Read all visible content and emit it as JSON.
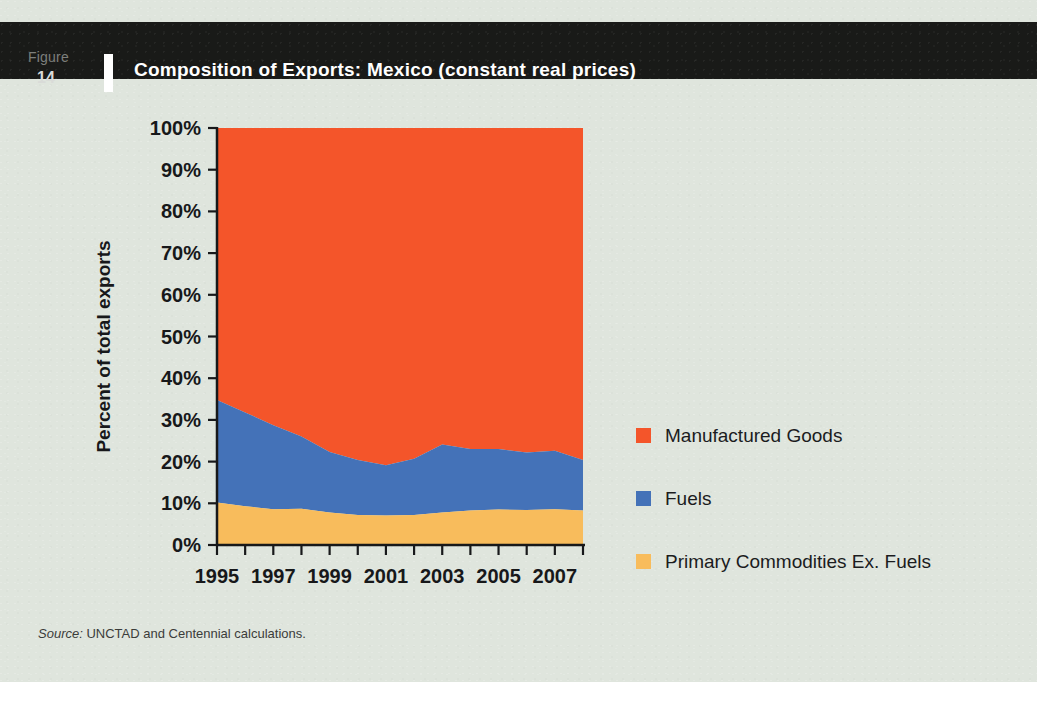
{
  "figure": {
    "label": "Figure",
    "number": "14",
    "title": "Composition of Exports: Mexico (constant real prices)"
  },
  "colors": {
    "background": "#dfe5dd",
    "header": "#191a18",
    "manufactured": "#F4552A",
    "fuels": "#4472B8",
    "primary": "#F8BC5C",
    "axis": "#17181a"
  },
  "legend": {
    "items": [
      {
        "label": "Manufactured Goods",
        "color": "#F4552A",
        "swatch": "legend-swatch-manufactured"
      },
      {
        "label": "Fuels",
        "color": "#4472B8",
        "swatch": "legend-swatch-fuels"
      },
      {
        "label": "Primary Commodities Ex. Fuels",
        "color": "#F8BC5C",
        "swatch": "legend-swatch-primary"
      }
    ]
  },
  "source": {
    "label": "Source:",
    "text": "UNCTAD and Centennial calculations."
  },
  "chart_data": {
    "type": "area",
    "stacked": true,
    "normalized": true,
    "title": "Composition of Exports: Mexico (constant real prices)",
    "xlabel": "",
    "ylabel": "Percent of total exports",
    "ylim": [
      0,
      100
    ],
    "yticks": [
      0,
      10,
      20,
      30,
      40,
      50,
      60,
      70,
      80,
      90,
      100
    ],
    "ytick_labels": [
      "0%",
      "10%",
      "20%",
      "30%",
      "40%",
      "50%",
      "60%",
      "70%",
      "80%",
      "90%",
      "100%"
    ],
    "x": [
      1995,
      1996,
      1997,
      1998,
      1999,
      2000,
      2001,
      2002,
      2003,
      2004,
      2005,
      2006,
      2007,
      2008
    ],
    "xticks": [
      1995,
      1996,
      1997,
      1998,
      1999,
      2000,
      2001,
      2002,
      2003,
      2004,
      2005,
      2006,
      2007,
      2008
    ],
    "xtick_labels": [
      "1995",
      "",
      "1997",
      "",
      "1999",
      "",
      "2001",
      "",
      "2003",
      "",
      "2005",
      "",
      "2007",
      ""
    ],
    "xtick_labels_shown": [
      "1995",
      "1997",
      "1999",
      "2001",
      "2003",
      "2005",
      "2007"
    ],
    "grid": false,
    "legend_position": "right",
    "series": [
      {
        "name": "Primary Commodities Ex. Fuels",
        "color": "#F8BC5C",
        "values": [
          10.2,
          9.3,
          8.6,
          8.7,
          7.8,
          7.2,
          7.1,
          7.2,
          7.8,
          8.3,
          8.5,
          8.4,
          8.6,
          8.3
        ]
      },
      {
        "name": "Fuels",
        "color": "#4472B8",
        "values": [
          24.6,
          22.5,
          20.1,
          17.3,
          14.5,
          13.2,
          12.0,
          13.5,
          16.3,
          14.7,
          14.5,
          13.8,
          14.0,
          12.1
        ]
      },
      {
        "name": "Manufactured Goods",
        "color": "#F4552A",
        "values": [
          65.2,
          68.2,
          71.3,
          74.0,
          77.7,
          79.6,
          80.9,
          79.3,
          75.9,
          77.0,
          77.0,
          77.8,
          77.4,
          79.6
        ]
      }
    ],
    "cumulative_tops": {
      "primary": [
        10.2,
        9.3,
        8.6,
        8.7,
        7.8,
        7.2,
        7.1,
        7.2,
        7.8,
        8.3,
        8.5,
        8.4,
        8.6,
        8.3
      ],
      "fuels": [
        34.8,
        31.8,
        28.7,
        26.0,
        22.3,
        20.4,
        19.1,
        20.7,
        24.1,
        23.0,
        23.0,
        22.2,
        22.6,
        20.4
      ],
      "manufactured": [
        100,
        100,
        100,
        100,
        100,
        100,
        100,
        100,
        100,
        100,
        100,
        100,
        100,
        100
      ]
    }
  }
}
